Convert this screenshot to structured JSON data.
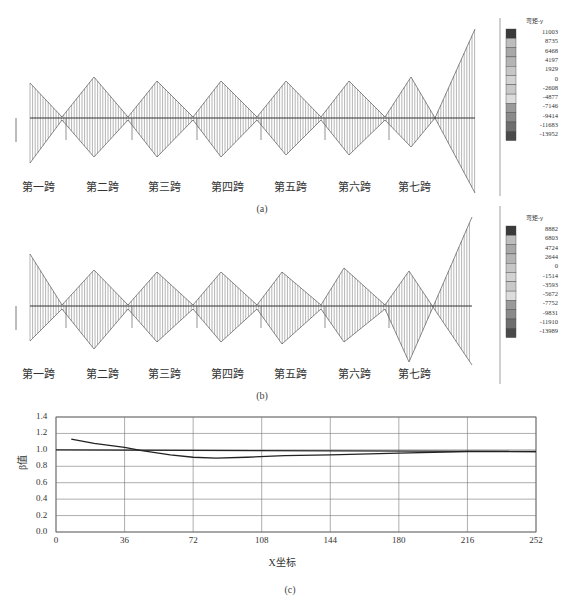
{
  "panels": [
    {
      "id": "a",
      "caption": "(a)",
      "legend": {
        "title": "弯矩-y",
        "values": [
          "11003",
          "8735",
          "6468",
          "4197",
          "1929",
          "0",
          "-2608",
          "-4877",
          "-7146",
          "-9414",
          "-11683",
          "-13952"
        ],
        "colors": [
          "#3a3a3a",
          "#bdbdbd",
          "#a8a8a8",
          "#b4b4b4",
          "#c6c6c6",
          "#d2d2d2",
          "#c9c9c9",
          "#dcdcdc",
          "#9a9a9a",
          "#8a8a8a",
          "#6e6e6e",
          "#4a4a4a"
        ]
      },
      "spans": [
        "第一跨",
        "第二跨",
        "第三跨",
        "第四跨",
        "第五跨",
        "第六跨",
        "第七跨"
      ]
    },
    {
      "id": "b",
      "caption": "(b)",
      "legend": {
        "title": "弯矩-y",
        "values": [
          "8882",
          "6803",
          "4724",
          "2644",
          "0",
          "-1514",
          "-3593",
          "-5672",
          "-7752",
          "-9831",
          "-11910",
          "-13989"
        ],
        "colors": [
          "#3a3a3a",
          "#bdbdbd",
          "#a8a8a8",
          "#b4b4b4",
          "#c6c6c6",
          "#d2d2d2",
          "#c9c9c9",
          "#dcdcdc",
          "#9a9a9a",
          "#8a8a8a",
          "#6e6e6e",
          "#4a4a4a"
        ]
      },
      "spans": [
        "第一跨",
        "第二跨",
        "第三跨",
        "第四跨",
        "第五跨",
        "第六跨",
        "第七跨"
      ]
    },
    {
      "id": "c",
      "caption": "(c)"
    }
  ],
  "diagram_a": {
    "baseline_y": 118,
    "supports_x": [
      30,
      62,
      128,
      193,
      257,
      321,
      385
    ],
    "outline_top": [
      [
        30,
        83
      ],
      [
        62,
        117
      ],
      [
        94,
        77
      ],
      [
        128,
        117
      ],
      [
        157,
        81
      ],
      [
        193,
        117
      ],
      [
        221,
        81
      ],
      [
        257,
        117
      ],
      [
        286,
        81
      ],
      [
        321,
        117
      ],
      [
        349,
        81
      ],
      [
        385,
        117
      ],
      [
        411,
        77
      ],
      [
        435,
        118
      ],
      [
        475,
        29
      ]
    ],
    "outline_bottom": [
      [
        30,
        163
      ],
      [
        62,
        120
      ],
      [
        94,
        157
      ],
      [
        128,
        120
      ],
      [
        157,
        157
      ],
      [
        193,
        120
      ],
      [
        221,
        157
      ],
      [
        257,
        120
      ],
      [
        286,
        155
      ],
      [
        321,
        120
      ],
      [
        349,
        155
      ],
      [
        385,
        120
      ],
      [
        411,
        147
      ],
      [
        435,
        118
      ],
      [
        475,
        193
      ]
    ],
    "label_y": 178,
    "label_x": [
      38,
      102,
      164,
      227,
      290,
      354,
      414
    ]
  },
  "diagram_b": {
    "baseline_y": 306,
    "supports_x": [
      30,
      62,
      128,
      193,
      257,
      321,
      385
    ],
    "outline_top": [
      [
        30,
        254
      ],
      [
        62,
        305
      ],
      [
        94,
        270
      ],
      [
        128,
        305
      ],
      [
        157,
        272
      ],
      [
        193,
        305
      ],
      [
        221,
        272
      ],
      [
        257,
        305
      ],
      [
        282,
        272
      ],
      [
        321,
        305
      ],
      [
        344,
        268
      ],
      [
        385,
        305
      ],
      [
        409,
        271
      ],
      [
        433,
        307
      ],
      [
        472,
        217
      ]
    ],
    "outline_bottom": [
      [
        30,
        341
      ],
      [
        62,
        309
      ],
      [
        94,
        349
      ],
      [
        128,
        309
      ],
      [
        157,
        342
      ],
      [
        193,
        309
      ],
      [
        221,
        342
      ],
      [
        257,
        309
      ],
      [
        282,
        344
      ],
      [
        321,
        309
      ],
      [
        344,
        342
      ],
      [
        385,
        309
      ],
      [
        409,
        362
      ],
      [
        433,
        307
      ],
      [
        472,
        365
      ]
    ],
    "label_y": 365,
    "label_x": [
      38,
      102,
      164,
      227,
      290,
      354,
      414
    ]
  },
  "chart_data": {
    "type": "line",
    "title": "",
    "xlabel": "X坐标",
    "ylabel": "β值",
    "xlim": [
      0,
      252
    ],
    "ylim": [
      0.0,
      1.4
    ],
    "x_ticks": [
      "0",
      "36",
      "72",
      "108",
      "144",
      "180",
      "216",
      "252"
    ],
    "y_ticks": [
      "0.0",
      "0.2",
      "0.4",
      "0.6",
      "0.8",
      "1.0",
      "1.2",
      "1.4"
    ],
    "grid": true,
    "series": [
      {
        "name": "β",
        "x": [
          8,
          20,
          36,
          45,
          60,
          72,
          84,
          100,
          120,
          144,
          180,
          216,
          252
        ],
        "values": [
          1.13,
          1.08,
          1.03,
          0.99,
          0.94,
          0.91,
          0.9,
          0.91,
          0.93,
          0.94,
          0.96,
          0.98,
          0.98
        ]
      },
      {
        "name": "reference",
        "x": [
          0,
          252
        ],
        "values": [
          1.0,
          0.98
        ]
      }
    ]
  }
}
